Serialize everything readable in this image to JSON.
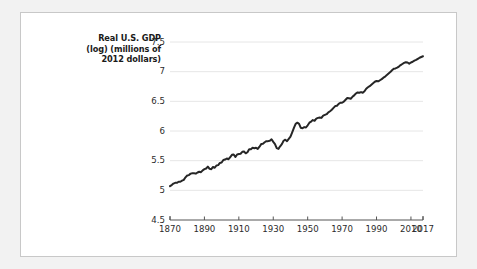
{
  "figure": {
    "background_color": "#ffffff",
    "page_color": "#f2f2f2",
    "border_color": "#c8c8c8"
  },
  "chart_data": {
    "type": "line",
    "title": "",
    "subtitle": "",
    "ylabel": "Real U.S. GDP (log) (millions of 2012 dollars)",
    "ylabel_lines": [
      "Real U.S. GDP",
      "(log) (millions of",
      "2012 dollars)"
    ],
    "xlabel": "",
    "xlim": [
      1870,
      2017
    ],
    "ylim": [
      4.5,
      7.5
    ],
    "xticks": [
      1870,
      1890,
      1910,
      1930,
      1950,
      1970,
      1990,
      2010,
      2017
    ],
    "xticklabels": [
      "1870",
      "1890",
      "1910",
      "1930",
      "1950",
      "1970",
      "1990",
      "2010",
      "2017"
    ],
    "yticks": [
      4.5,
      5,
      5.5,
      6,
      6.5,
      7,
      7.5
    ],
    "yticklabels": [
      "4.5",
      "5",
      "5.5",
      "6",
      "6.5",
      "7",
      "7.5"
    ],
    "grid": "horizontal",
    "grid_color": "#e6e6e6",
    "legend": "none",
    "line_color": "#262626",
    "line_width": 2.0,
    "series": [
      {
        "name": "Real U.S. GDP (log)",
        "x": [
          1870,
          1871,
          1872,
          1873,
          1874,
          1875,
          1876,
          1877,
          1878,
          1879,
          1880,
          1881,
          1882,
          1883,
          1884,
          1885,
          1886,
          1887,
          1888,
          1889,
          1890,
          1891,
          1892,
          1893,
          1894,
          1895,
          1896,
          1897,
          1898,
          1899,
          1900,
          1901,
          1902,
          1903,
          1904,
          1905,
          1906,
          1907,
          1908,
          1909,
          1910,
          1911,
          1912,
          1913,
          1914,
          1915,
          1916,
          1917,
          1918,
          1919,
          1920,
          1921,
          1922,
          1923,
          1924,
          1925,
          1926,
          1927,
          1928,
          1929,
          1930,
          1931,
          1932,
          1933,
          1934,
          1935,
          1936,
          1937,
          1938,
          1939,
          1940,
          1941,
          1942,
          1943,
          1944,
          1945,
          1946,
          1947,
          1948,
          1949,
          1950,
          1951,
          1952,
          1953,
          1954,
          1955,
          1956,
          1957,
          1958,
          1959,
          1960,
          1961,
          1962,
          1963,
          1964,
          1965,
          1966,
          1967,
          1968,
          1969,
          1970,
          1971,
          1972,
          1973,
          1974,
          1975,
          1976,
          1977,
          1978,
          1979,
          1980,
          1981,
          1982,
          1983,
          1984,
          1985,
          1986,
          1987,
          1988,
          1989,
          1990,
          1991,
          1992,
          1993,
          1994,
          1995,
          1996,
          1997,
          1998,
          1999,
          2000,
          2001,
          2002,
          2003,
          2004,
          2005,
          2006,
          2007,
          2008,
          2009,
          2010,
          2011,
          2012,
          2013,
          2014,
          2015,
          2016,
          2017
        ],
        "values": [
          5.07,
          5.1,
          5.14,
          5.16,
          5.16,
          5.19,
          5.19,
          5.22,
          5.24,
          5.31,
          5.36,
          5.37,
          5.41,
          5.42,
          5.42,
          5.41,
          5.44,
          5.46,
          5.45,
          5.5,
          5.53,
          5.55,
          5.6,
          5.54,
          5.53,
          5.59,
          5.57,
          5.63,
          5.64,
          5.7,
          5.71,
          5.78,
          5.79,
          5.82,
          5.8,
          5.86,
          5.92,
          5.93,
          5.86,
          5.93,
          5.94,
          5.95,
          6.0,
          6.01,
          5.96,
          5.99,
          6.07,
          6.07,
          6.11,
          6.1,
          6.11,
          6.08,
          6.14,
          6.21,
          6.22,
          6.26,
          6.29,
          6.29,
          6.3,
          6.34,
          6.27,
          6.21,
          6.1,
          6.08,
          6.15,
          6.21,
          6.3,
          6.33,
          6.29,
          6.35,
          6.41,
          6.53,
          6.65,
          6.76,
          6.79,
          6.76,
          6.65,
          6.64,
          6.67,
          6.66,
          6.72,
          6.79,
          6.82,
          6.86,
          6.84,
          6.9,
          6.92,
          6.93,
          6.92,
          6.98,
          7.0,
          7.02,
          7.07,
          7.1,
          7.14,
          7.19,
          7.24,
          7.25,
          7.3,
          7.33,
          7.33,
          7.36,
          7.41,
          7.46,
          7.45,
          7.44,
          7.49,
          7.53,
          7.58,
          7.61,
          7.6,
          7.62,
          7.6,
          7.64,
          7.71,
          7.75,
          7.78,
          7.82,
          7.86,
          7.9,
          7.92,
          7.91,
          7.94,
          7.97,
          8.01,
          8.04,
          8.08,
          8.12,
          8.16,
          8.21,
          8.25,
          8.26,
          8.28,
          8.31,
          8.35,
          8.38,
          8.41,
          8.43,
          8.42,
          8.39,
          8.42,
          8.44,
          8.47,
          8.49,
          8.52,
          8.55,
          8.57,
          8.59
        ],
        "values_plot": [
          5.07,
          5.1,
          5.14,
          5.16,
          5.16,
          5.19,
          5.19,
          5.22,
          5.24,
          5.31,
          5.36,
          5.37,
          5.41,
          5.42,
          5.42,
          5.41,
          5.44,
          5.46,
          5.45,
          5.5,
          5.53,
          5.55,
          5.6,
          5.54,
          5.53,
          5.59,
          5.57,
          5.63,
          5.64,
          5.7,
          5.71,
          5.78,
          5.79,
          5.82,
          5.8,
          5.86,
          5.92,
          5.93,
          5.86,
          5.93,
          5.94,
          5.95,
          6.0,
          6.01,
          5.96,
          5.99,
          6.07,
          6.07,
          6.11,
          6.1,
          6.11,
          6.08,
          6.14,
          6.21,
          6.22,
          6.26,
          6.29,
          6.29,
          6.3,
          6.34,
          6.27,
          6.21,
          6.1,
          6.08,
          6.15,
          6.21,
          6.3,
          6.33,
          6.29,
          6.35,
          6.41,
          6.53,
          6.65,
          6.76,
          6.79,
          6.76,
          6.65,
          6.64,
          6.67,
          6.66,
          6.72,
          6.79,
          6.82,
          6.86,
          6.84,
          6.9,
          6.92,
          6.93,
          6.92,
          6.98,
          7.0,
          7.02,
          7.07,
          7.1,
          7.14,
          7.19,
          7.24,
          7.25,
          7.3,
          7.33,
          7.33,
          7.36,
          7.41,
          7.46,
          7.45,
          7.44,
          7.49,
          7.53,
          7.58,
          7.61,
          7.6,
          7.62,
          7.6,
          7.64,
          7.71,
          7.75,
          7.78,
          7.82,
          7.86,
          7.9,
          7.92,
          7.91,
          7.94,
          7.97,
          8.01,
          8.04,
          8.08,
          8.12,
          8.16,
          8.21,
          8.25,
          8.26,
          8.28,
          8.31,
          8.35,
          8.38,
          8.41,
          8.43,
          8.42,
          8.39,
          8.42,
          8.44,
          8.47,
          8.49,
          8.52,
          8.55,
          8.57,
          8.59
        ]
      }
    ],
    "notes": {
      "start_value": 5.07,
      "end_value": 7.26,
      "depression_trough_year": 1933,
      "wwii_peak_year": 1944
    }
  }
}
